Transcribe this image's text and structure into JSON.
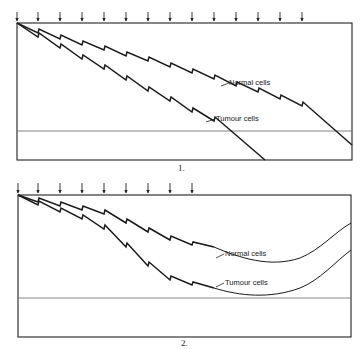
{
  "diagrams": [
    {
      "caption": "1.",
      "labels": {
        "normal": "Normal cells",
        "tumour": "Tumour cells"
      },
      "dose_arrow_count": 14
    },
    {
      "caption": "2.",
      "labels": {
        "normal": "Normal cells",
        "tumour": "Tumour cells"
      },
      "dose_arrow_count": 9
    }
  ],
  "colors": {
    "line": "#1a1a1a",
    "threshold": "#666666",
    "background": "#ffffff"
  }
}
